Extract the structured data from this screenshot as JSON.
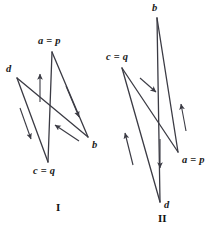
{
  "figure": {
    "caption_area": "two-labelled-quadrilateral-vector-diagrams",
    "stroke_color": "#3b3b44",
    "label_color": "#1a1a1a",
    "background": "#ffffff"
  },
  "figure_one": {
    "name": "I",
    "caption": "I",
    "vertices": [
      {
        "key": "a_p",
        "label": "a = p",
        "x": 52,
        "y": 52,
        "label_x": 38,
        "label_y": 36
      },
      {
        "key": "d",
        "label": "d",
        "x": 17,
        "y": 78,
        "label_x": 6,
        "label_y": 64
      },
      {
        "key": "b",
        "label": "b",
        "x": 88,
        "y": 137,
        "label_x": 92,
        "label_y": 140
      },
      {
        "key": "c_q",
        "label": "c = q",
        "x": 48,
        "y": 162,
        "label_x": 33,
        "label_y": 166
      }
    ],
    "edges": [
      {
        "from": "a_p",
        "to": "b",
        "name": "edge-a-to-b"
      },
      {
        "from": "b",
        "to": "d",
        "name": "edge-b-to-d"
      },
      {
        "from": "d",
        "to": "c_q",
        "name": "edge-d-to-c"
      },
      {
        "from": "c_q",
        "to": "a_p",
        "name": "edge-c-to-a"
      }
    ],
    "arrows": [
      {
        "name": "arrow-up-along-c-to-a",
        "x1": 40,
        "y1": 102,
        "x2": 40,
        "y2": 74,
        "direction": "up"
      },
      {
        "name": "arrow-down-along-a-to-b",
        "x1": 66,
        "y1": 86,
        "x2": 79,
        "y2": 117,
        "direction": "down-right"
      },
      {
        "name": "arrow-down-along-d-to-c",
        "x1": 20,
        "y1": 108,
        "x2": 31,
        "y2": 139,
        "direction": "down-right"
      },
      {
        "name": "arrow-up-along-b-to-d",
        "x1": 79,
        "y1": 141,
        "x2": 55,
        "y2": 125,
        "direction": "up-left"
      }
    ]
  },
  "figure_two": {
    "name": "II",
    "caption": "II",
    "vertices": [
      {
        "key": "b",
        "label": "b",
        "x": 157,
        "y": 18,
        "label_x": 152,
        "label_y": 3
      },
      {
        "key": "c_q",
        "label": "c = q",
        "x": 122,
        "y": 68,
        "label_x": 106,
        "label_y": 52
      },
      {
        "key": "a_p",
        "label": "a = p",
        "x": 178,
        "y": 152,
        "label_x": 182,
        "label_y": 155
      },
      {
        "key": "d",
        "label": "d",
        "x": 160,
        "y": 202,
        "label_x": 164,
        "label_y": 200
      }
    ],
    "edges": [
      {
        "from": "c_q",
        "to": "a_p",
        "name": "edge-c-to-a"
      },
      {
        "from": "a_p",
        "to": "b",
        "name": "edge-a-to-b"
      },
      {
        "from": "b",
        "to": "d",
        "name": "edge-b-to-d"
      },
      {
        "from": "d",
        "to": "c_q",
        "name": "edge-d-to-c"
      }
    ],
    "arrows": [
      {
        "name": "arrow-down-along-c-to-a",
        "x1": 140,
        "y1": 78,
        "x2": 156,
        "y2": 92,
        "direction": "down-right"
      },
      {
        "name": "arrow-up-along-a-to-b",
        "x1": 186,
        "y1": 131,
        "x2": 181,
        "y2": 104,
        "direction": "up"
      },
      {
        "name": "arrow-down-along-b-to-d",
        "x1": 160,
        "y1": 139,
        "x2": 160,
        "y2": 168,
        "direction": "down"
      },
      {
        "name": "arrow-up-along-d-to-c",
        "x1": 133,
        "y1": 165,
        "x2": 125,
        "y2": 133,
        "direction": "up-left"
      }
    ]
  },
  "captions": {
    "figure_one_label": "I",
    "figure_one_label_x": 56,
    "figure_one_label_y": 202,
    "figure_two_label": "II",
    "figure_two_label_x": 158,
    "figure_two_label_y": 213
  }
}
